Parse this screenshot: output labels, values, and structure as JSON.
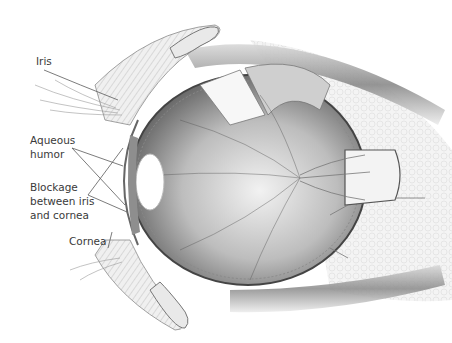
{
  "figure": {
    "colors": {
      "background": "#ffffff",
      "line": "#555555",
      "tissue_light": "#e6e6e6",
      "tissue_mid": "#b5b5b5",
      "tissue_dark": "#6e6e6e",
      "label_text": "#3a3a3a"
    }
  },
  "labels": {
    "iris": "Iris",
    "aqueous_humor": "Aqueous\nhumor",
    "blockage": "Blockage\nbetween iris\nand cornea",
    "cornea": "Cornea"
  }
}
